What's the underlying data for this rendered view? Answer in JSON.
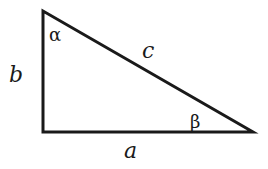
{
  "diagram": {
    "type": "right-triangle",
    "stroke_color": "#1a1a1a",
    "vertices": {
      "top": [
        43,
        11
      ],
      "right_angle": [
        43,
        132
      ],
      "right": [
        253,
        132
      ]
    },
    "sides": {
      "vertical_leg": "b",
      "horizontal_leg": "a",
      "hypotenuse": "c"
    },
    "angles": {
      "top_angle": "α",
      "right_angle_vertex_label": "",
      "right_vertex_angle": "β"
    }
  }
}
